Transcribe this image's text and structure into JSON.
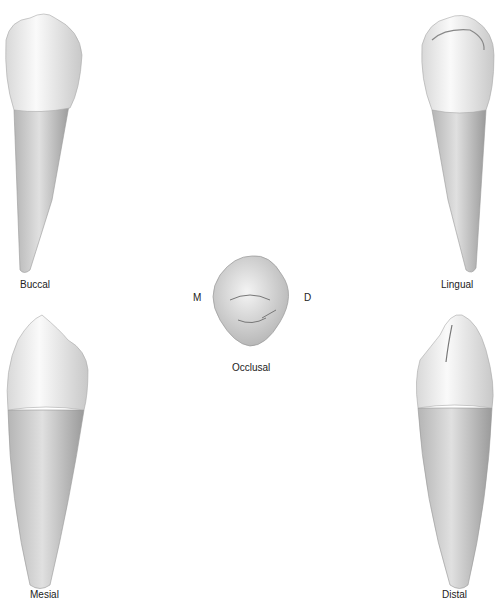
{
  "figure": {
    "views": {
      "buccal": {
        "label": "Buccal"
      },
      "lingual": {
        "label": "Lingual"
      },
      "occlusal": {
        "label": "Occlusal",
        "mesial_marker": "M",
        "distal_marker": "D"
      },
      "mesial": {
        "label": "Mesial"
      },
      "distal": {
        "label": "Distal"
      }
    }
  }
}
